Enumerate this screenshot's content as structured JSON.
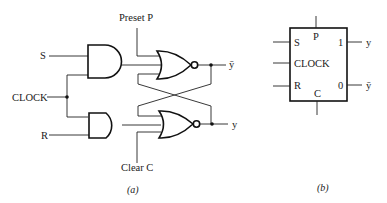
{
  "figure_a": {
    "caption": "(a)",
    "inputs": {
      "preset": "Preset P",
      "s": "S",
      "clock": "CLOCK",
      "r": "R",
      "clear": "Clear C"
    },
    "outputs": {
      "y_bar": "ȳ",
      "y": "y"
    },
    "gates": [
      {
        "type": "AND",
        "name": "top-and",
        "inputs": [
          "S",
          "CLOCK"
        ]
      },
      {
        "type": "AND",
        "name": "bottom-and",
        "inputs": [
          "CLOCK",
          "R"
        ]
      },
      {
        "type": "NOR",
        "name": "top-nor",
        "inputs": [
          "Preset P",
          "top-and",
          "y"
        ],
        "output": "ȳ"
      },
      {
        "type": "NOR",
        "name": "bottom-nor",
        "inputs": [
          "ȳ",
          "bottom-and",
          "Clear C"
        ],
        "output": "y"
      }
    ]
  },
  "figure_b": {
    "caption": "(b)",
    "pins": {
      "p": "P",
      "s": "S",
      "clock": "CLOCK",
      "r": "R",
      "c": "C",
      "one": "1",
      "zero": "0"
    },
    "outputs": {
      "y": "y",
      "y_bar": "ȳ"
    }
  }
}
